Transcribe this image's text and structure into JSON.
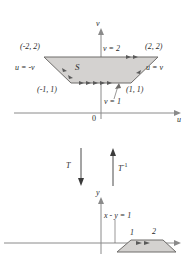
{
  "figure": {
    "background_color": "#ffffff",
    "region_fill_color": "#d4d2d0",
    "region_stroke_color": "#6e6c6a",
    "axis_color": "#8a8a8a",
    "text_color": "#2b2b2b"
  },
  "uv_plane": {
    "axis_labels": {
      "horizontal": "u",
      "vertical": "v",
      "origin": "0"
    },
    "region_label": "S",
    "vertex_labels": [
      {
        "text": "(-2, 2)",
        "corner": "top-left"
      },
      {
        "text": "(2, 2)",
        "corner": "top-right"
      },
      {
        "text": "(-1, 1)",
        "corner": "bottom-left"
      },
      {
        "text": "(1, 1)",
        "corner": "bottom-right"
      }
    ],
    "edge_labels": [
      {
        "text": "v = 2",
        "edge": "top"
      },
      {
        "text": "v = 1",
        "edge": "bottom"
      },
      {
        "text": "u = -v",
        "edge": "left"
      },
      {
        "text": "u = v",
        "edge": "right"
      }
    ]
  },
  "transform_arrows": {
    "forward": "T",
    "inverse_base": "T",
    "inverse_exponent": "-1"
  },
  "xy_plane": {
    "axis_labels": {
      "vertical": "y"
    },
    "line_label": "x - y = 1",
    "tick_labels": [
      "1",
      "2"
    ]
  }
}
